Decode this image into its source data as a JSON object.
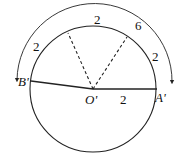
{
  "diagram": {
    "type": "geometry",
    "center_label": "O'",
    "point_a_label": "A'",
    "point_b_label": "B'",
    "radius_label": "2",
    "arc_labels": {
      "left_arc": "2",
      "top_arc": "2",
      "right_arc": "2",
      "outer_arc_total": "6"
    },
    "colors": {
      "stroke": "#222222",
      "background": "#ffffff"
    }
  }
}
